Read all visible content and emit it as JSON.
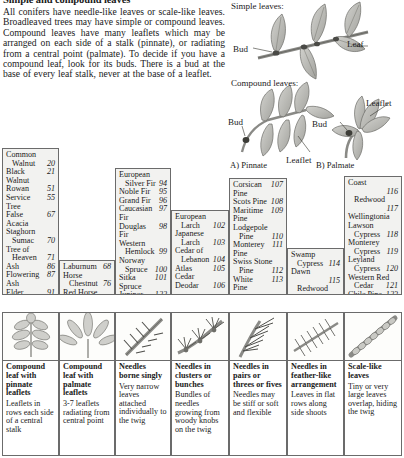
{
  "intro": {
    "title": "Simple and compound leaves",
    "body": "All conifers have needle-like leaves or scale-like leaves. Broadleaved trees may have simple or compound leaves. Compound leaves have many leaflets which may be arranged on each side of a stalk (pinnate), or radiating from a central point (palmate). To decide if you have a compound leaf, look for its buds. There is a bud at the base of every leaf stalk, never at the base of a leaflet."
  },
  "diagrams": {
    "simple_heading": "Simple leaves:",
    "compound_heading": "Compound leaves:",
    "bud_label_1": "Bud",
    "leaf_label": "Leaf",
    "bud_label_2": "Bud",
    "leaflet_label_1": "Leaflet",
    "bud_label_3": "Bud",
    "leaflet_label_2": "Leaflet",
    "caption_a": "A) Pinnate",
    "caption_b": "B) Palmate"
  },
  "index_columns": [
    {
      "id": "pinnate",
      "species": [
        {
          "lines": [
            "Common",
            "Walnut"
          ],
          "no": "20"
        },
        {
          "lines": [
            "Black Walnut",
            ""
          ],
          "no": "21"
        },
        {
          "lines": [
            "Rowan"
          ],
          "no": "51"
        },
        {
          "lines": [
            "Service Tree",
            ""
          ],
          "no": "55"
        },
        {
          "lines": [
            "False Acacia",
            ""
          ],
          "no": "67"
        },
        {
          "lines": [
            "Staghorn",
            "Sumac"
          ],
          "no": "70"
        },
        {
          "lines": [
            "Tree of",
            "Heaven"
          ],
          "no": "71"
        },
        {
          "lines": [
            "Ash"
          ],
          "no": "86"
        },
        {
          "lines": [
            "Flowering Ash",
            ""
          ],
          "no": "87"
        },
        {
          "lines": [
            "Elder"
          ],
          "no": "91"
        }
      ]
    },
    {
      "id": "palmate",
      "species": [
        {
          "lines": [
            "Laburnum"
          ],
          "no": "68"
        },
        {
          "lines": [
            "Horse",
            "Chestnut"
          ],
          "no": "76"
        },
        {
          "lines": [
            "Red Horse",
            "Chestnut"
          ],
          "no": "77"
        }
      ]
    },
    {
      "id": "singly",
      "species": [
        {
          "lines": [
            "European",
            "Silver Fir"
          ],
          "no": "94"
        },
        {
          "lines": [
            "Noble Fir"
          ],
          "no": "95"
        },
        {
          "lines": [
            "Grand Fir"
          ],
          "no": "96"
        },
        {
          "lines": [
            "Caucasian Fir",
            ""
          ],
          "no": "97"
        },
        {
          "lines": [
            "Douglas Fir",
            ""
          ],
          "no": "98"
        },
        {
          "lines": [
            "Western",
            "Hemlock"
          ],
          "no": "99"
        },
        {
          "lines": [
            "Norway",
            "Spruce"
          ],
          "no": "100"
        },
        {
          "lines": [
            "Sitka Spruce",
            ""
          ],
          "no": "101"
        },
        {
          "lines": [
            "Juniper"
          ],
          "no": "122"
        },
        {
          "lines": [
            "Yew"
          ],
          "no": "124"
        }
      ]
    },
    {
      "id": "clusters",
      "species": [
        {
          "lines": [
            "European",
            "Larch"
          ],
          "no": "102"
        },
        {
          "lines": [
            "Japanese",
            "Larch"
          ],
          "no": "103"
        },
        {
          "lines": [
            "Cedar of",
            "Lebanon"
          ],
          "no": "104"
        },
        {
          "lines": [
            "Atlas Cedar",
            ""
          ],
          "no": "105"
        },
        {
          "lines": [
            "Deodar"
          ],
          "no": "106"
        }
      ]
    },
    {
      "id": "pairs",
      "species": [
        {
          "lines": [
            "Corsican Pine",
            ""
          ],
          "no": "107"
        },
        {
          "lines": [
            "Scots Pine"
          ],
          "no": "108"
        },
        {
          "lines": [
            "Maritime Pine",
            ""
          ],
          "no": "109"
        },
        {
          "lines": [
            "Lodgepole",
            "Pine"
          ],
          "no": "110"
        },
        {
          "lines": [
            "Monterey Pine",
            ""
          ],
          "no": "111"
        },
        {
          "lines": [
            "Swiss Stone",
            "Pine"
          ],
          "no": "112"
        },
        {
          "lines": [
            "White Pine"
          ],
          "no": "113"
        }
      ]
    },
    {
      "id": "feather",
      "species": [
        {
          "lines": [
            "Swamp",
            "Cypress"
          ],
          "no": "114"
        },
        {
          "lines": [
            "Dawn",
            "Redwood"
          ],
          "no": "115"
        },
        {
          "lines": [
            "Coast",
            "Redwood"
          ],
          "no": "116"
        }
      ]
    },
    {
      "id": "scale",
      "species": [
        {
          "lines": [
            "Coast",
            "Redwood"
          ],
          "no": "116"
        },
        {
          "lines": [
            "Wellingtonia",
            ""
          ],
          "no": "117"
        },
        {
          "lines": [
            "Lawson",
            "Cypress"
          ],
          "no": "118"
        },
        {
          "lines": [
            "Monterey",
            "Cypress"
          ],
          "no": "119"
        },
        {
          "lines": [
            "Leyland",
            "Cypress"
          ],
          "no": "120"
        },
        {
          "lines": [
            "Western Red",
            "Cedar"
          ],
          "no": "121"
        },
        {
          "lines": [
            "Chile Pine"
          ],
          "no": "123"
        }
      ]
    }
  ],
  "cards": [
    {
      "id": "pinnate",
      "icon": "pinnate-leaf-icon",
      "heading": "Compound leaf with pinnate leaflets",
      "body": "Leaflets in rows each side of a central stalk"
    },
    {
      "id": "palmate",
      "icon": "palmate-leaf-icon",
      "heading": "Compound leaf with palmate leaflets",
      "body": "3-7 leaflets radiating from central point"
    },
    {
      "id": "singly",
      "icon": "single-needle-icon",
      "heading": "Needles borne singly",
      "body": "Very narrow leaves attached individually to the twig"
    },
    {
      "id": "clusters",
      "icon": "needle-cluster-icon",
      "heading": "Needles in clusters or bunches",
      "body": "Bundles of needles growing from woody knobs on the twig"
    },
    {
      "id": "pairs",
      "icon": "needle-pair-icon",
      "heading": "Needles in pairs or threes or fives",
      "body": "Needles may be stiff or soft and flexible"
    },
    {
      "id": "feather",
      "icon": "feather-needle-icon",
      "heading": "Needles in feather-like arrangement",
      "body": "Leaves in flat rows along side shoots"
    },
    {
      "id": "scale",
      "icon": "scale-leaf-icon",
      "heading": "Scale-like leaves",
      "body": "Tiny or very large leaves overlap, hiding the twig"
    }
  ],
  "colors": {
    "rule": "#6b6b6b",
    "panel": "#f2f2f0",
    "ink": "#1a1a1a",
    "leaf_fill": "#b8b8b4",
    "leaf_dark": "#8a8a86"
  }
}
